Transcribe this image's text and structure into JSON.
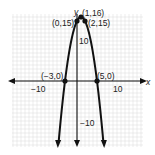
{
  "chart_data": {
    "type": "line",
    "title": "",
    "xlabel": "x",
    "ylabel": "y",
    "xlim": [
      -16,
      16
    ],
    "ylim": [
      -16,
      16
    ],
    "grid": true,
    "series": [
      {
        "name": "y = -x^2 + 2x + 15",
        "equation": "-(x-1)^2+16",
        "color": "#111111"
      }
    ],
    "points": [
      {
        "x": 0,
        "y": 15,
        "label": "(0,15)"
      },
      {
        "x": 1,
        "y": 16,
        "label": "(1,16)"
      },
      {
        "x": 2,
        "y": 15,
        "label": "(2,15)"
      },
      {
        "x": -3,
        "y": 0,
        "label": "(−3,0)"
      },
      {
        "x": 5,
        "y": 0,
        "label": "(5,0)"
      }
    ],
    "tick_labels": {
      "x": [
        "−10",
        "10"
      ],
      "y": [
        "10",
        "−10"
      ]
    }
  },
  "labels": {
    "x_axis": "x",
    "y_axis": "y",
    "x_neg10": "−10",
    "x_pos10": "10",
    "y_pos10": "10",
    "y_neg10": "−10",
    "p_0_15": "(0,15)",
    "p_1_16": "(1,16)",
    "p_2_15": "(2,15)",
    "p_m3_0": "(−3,0)",
    "p_5_0": "(5,0)"
  }
}
